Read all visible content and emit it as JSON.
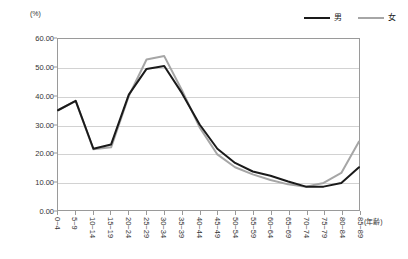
{
  "chart_data": {
    "type": "line",
    "title": "",
    "xlabel": "(年齢)",
    "ylabel": "(%)",
    "ylim": [
      0,
      60
    ],
    "ytick_step": 10,
    "ytick_labels": [
      "60.00",
      "50.00",
      "40.00",
      "30.00",
      "20.00",
      "10.00",
      "0.00"
    ],
    "ytick_values": [
      60,
      50,
      40,
      30,
      20,
      10,
      0
    ],
    "grid": true,
    "legend_position": "top-right",
    "categories": [
      "0~4",
      "5~9",
      "10~14",
      "15~19",
      "20~24",
      "25~29",
      "30~34",
      "35~39",
      "40~44",
      "45~49",
      "50~54",
      "55~59",
      "60~64",
      "65~69",
      "70~74",
      "75~79",
      "80~84",
      "85~89"
    ],
    "series": [
      {
        "name": "男",
        "color": "#1a1a1a",
        "values": [
          35.0,
          38.3,
          21.5,
          23.0,
          40.5,
          49.5,
          50.5,
          41.0,
          30.0,
          21.5,
          16.5,
          13.5,
          12.0,
          10.0,
          8.2,
          8.2,
          9.5,
          15.0
        ]
      },
      {
        "name": "女",
        "color": "#a6a6a6",
        "values": [
          35.0,
          38.3,
          21.3,
          22.0,
          40.0,
          52.8,
          54.0,
          42.0,
          29.0,
          19.5,
          15.0,
          12.5,
          10.5,
          9.0,
          8.2,
          9.5,
          13.0,
          24.0
        ]
      }
    ]
  },
  "legend": {
    "entries": [
      {
        "label": "男"
      },
      {
        "label": "女"
      }
    ]
  },
  "axes": {
    "y_unit_label": "(%)",
    "x_unit_label": "(年齢)"
  }
}
